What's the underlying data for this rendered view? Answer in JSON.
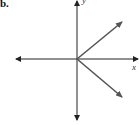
{
  "figure": {
    "part_label": "b.",
    "x_axis_label": "x",
    "y_axis_label": "y",
    "colors": {
      "axis": "#222222",
      "vector": "#555555"
    },
    "origin": [
      77,
      59
    ],
    "vectors": [
      {
        "name": "vector-up-right",
        "to": [
          122,
          22
        ]
      },
      {
        "name": "vector-down-right",
        "to": [
          122,
          97
        ]
      }
    ]
  }
}
